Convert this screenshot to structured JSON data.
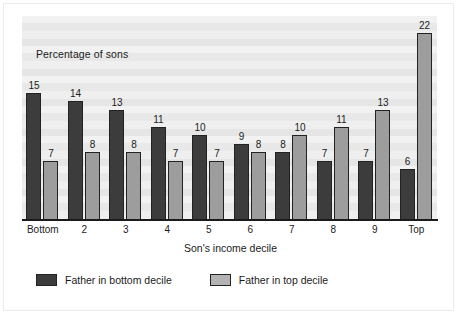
{
  "chart_data": {
    "type": "bar",
    "title": "Percentage of sons",
    "xlabel": "Son's income decile",
    "ylabel": "Percentage of sons",
    "categories": [
      "Bottom",
      "2",
      "3",
      "4",
      "5",
      "6",
      "7",
      "8",
      "9",
      "Top"
    ],
    "series": [
      {
        "name": "Father in bottom decile",
        "color": "#3c3c3c",
        "values": [
          15,
          14,
          13,
          11,
          10,
          9,
          8,
          7,
          7,
          6
        ]
      },
      {
        "name": "Father in top decile",
        "color": "#9d9d9d",
        "values": [
          7,
          8,
          8,
          7,
          7,
          8,
          10,
          11,
          13,
          22
        ]
      }
    ],
    "ylim": [
      0,
      24
    ],
    "grid": false,
    "legend_position": "bottom",
    "data_labels": true
  },
  "legend": {
    "items": [
      {
        "label": "Father in bottom decile",
        "swatch": "dark"
      },
      {
        "label": "Father in top decile",
        "swatch": "light"
      }
    ]
  },
  "axis": {
    "x_title": "Son's income decile"
  },
  "note": {
    "text": "Percentage of sons"
  }
}
